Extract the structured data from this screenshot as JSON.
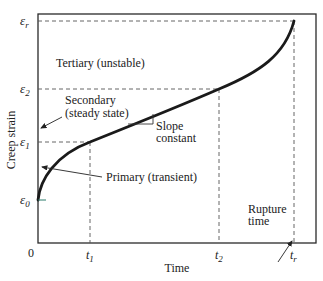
{
  "diagram": {
    "y_axis_label": "Creep strain",
    "x_axis_label": "Time",
    "origin_label": "0",
    "y_ticks": [
      {
        "symbol": "ε",
        "sub": "0",
        "y": 200
      },
      {
        "symbol": "ε",
        "sub": "1",
        "y": 142
      },
      {
        "symbol": "ε",
        "sub": "2",
        "y": 89
      },
      {
        "symbol": "ε",
        "sub": "r",
        "y": 21
      }
    ],
    "x_ticks": [
      {
        "symbol": "t",
        "sub": "1",
        "x": 90
      },
      {
        "symbol": "t",
        "sub": "2",
        "x": 219
      },
      {
        "symbol": "t",
        "sub": "r",
        "x": 294
      }
    ],
    "annotations": {
      "tertiary": "Tertiary (unstable)",
      "secondary_line1": "Secondary",
      "secondary_line2": "(steady state)",
      "slope_line1": "Slope",
      "slope_line2": "constant",
      "primary": "Primary (transient)",
      "rupture_line1": "Rupture",
      "rupture_line2": "time"
    },
    "stages": [
      "Primary (transient)",
      "Secondary (steady state)",
      "Tertiary (unstable)"
    ],
    "colors": {
      "curve": "#1a1a1a",
      "frame": "#2a2a2a",
      "dashed": "#555555",
      "background": "#ffffff"
    }
  }
}
